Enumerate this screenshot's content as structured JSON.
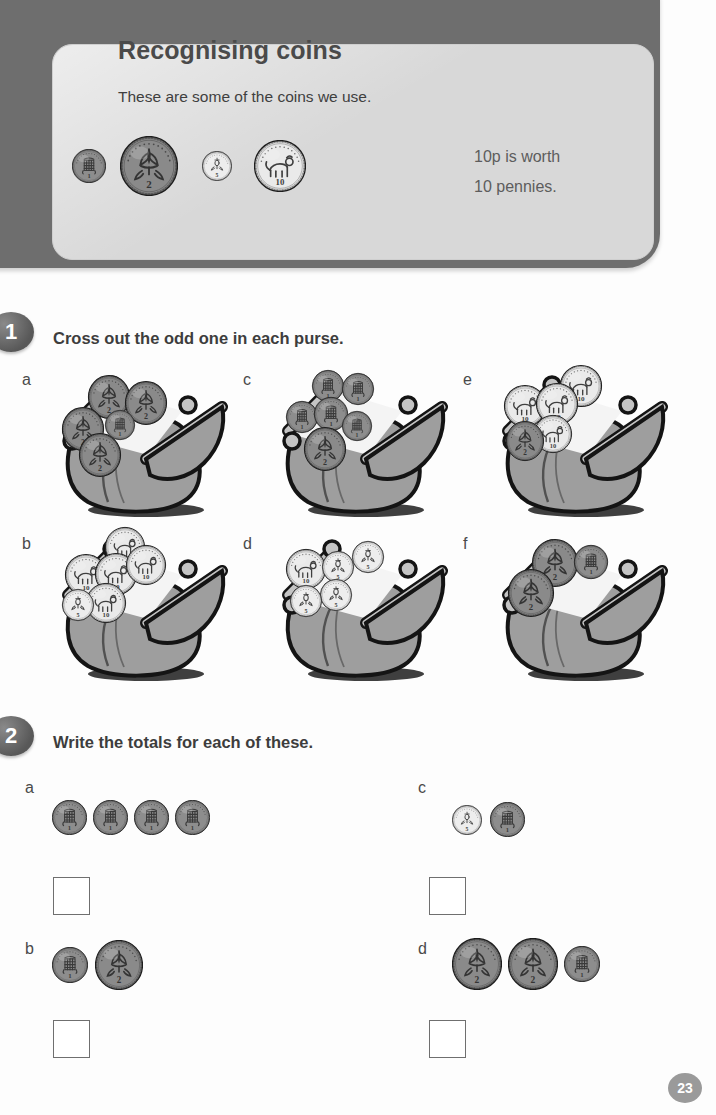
{
  "header": {
    "title": "Recognising coins",
    "subtitle": "These are some of the coins we use.",
    "note": "10p is worth\n10 pennies.",
    "coins": [
      {
        "value": "1",
        "type": "1p",
        "icon": "coin-1p-icon"
      },
      {
        "value": "2",
        "type": "2p",
        "icon": "coin-2p-icon"
      },
      {
        "value": "5",
        "type": "5p",
        "icon": "coin-5p-icon"
      },
      {
        "value": "10",
        "type": "10p",
        "icon": "coin-10p-icon"
      }
    ]
  },
  "questions": [
    {
      "number": "1",
      "prompt": "Cross out the odd one in each purse.",
      "items": [
        {
          "label": "a",
          "coins": [
            "2p",
            "2p",
            "2p",
            "2p",
            "1p"
          ],
          "odd": "1p"
        },
        {
          "label": "b",
          "coins": [
            "10p",
            "10p",
            "10p",
            "10p",
            "5p"
          ],
          "odd": "5p"
        },
        {
          "label": "c",
          "coins": [
            "1p",
            "1p",
            "1p",
            "1p",
            "1p",
            "2p"
          ],
          "odd": "2p"
        },
        {
          "label": "d",
          "coins": [
            "5p",
            "5p",
            "5p",
            "5p",
            "10p"
          ],
          "odd": "10p"
        },
        {
          "label": "e",
          "coins": [
            "10p",
            "10p",
            "10p",
            "10p",
            "2p"
          ],
          "odd": "2p"
        },
        {
          "label": "f",
          "coins": [
            "2p",
            "2p",
            "1p"
          ],
          "odd": "1p"
        }
      ]
    },
    {
      "number": "2",
      "prompt": "Write the totals for each of these.",
      "items": [
        {
          "label": "a",
          "coins": [
            "1p",
            "1p",
            "1p",
            "1p"
          ],
          "answer": ""
        },
        {
          "label": "b",
          "coins": [
            "1p",
            "2p"
          ],
          "answer": ""
        },
        {
          "label": "c",
          "coins": [
            "5p",
            "1p"
          ],
          "answer": ""
        },
        {
          "label": "d",
          "coins": [
            "2p",
            "2p",
            "1p"
          ],
          "answer": ""
        }
      ]
    }
  ],
  "page_number": "23",
  "colors": {
    "frame": "#6e6e6e",
    "panel": "#d8d8d8",
    "text": "#3d3d3d",
    "purse_body": "#9a9a9a",
    "purse_clasp": "#c2c2c2",
    "bronze": "#8f8f8f",
    "silver": "#ededed",
    "outline": "#1a1a1a"
  }
}
